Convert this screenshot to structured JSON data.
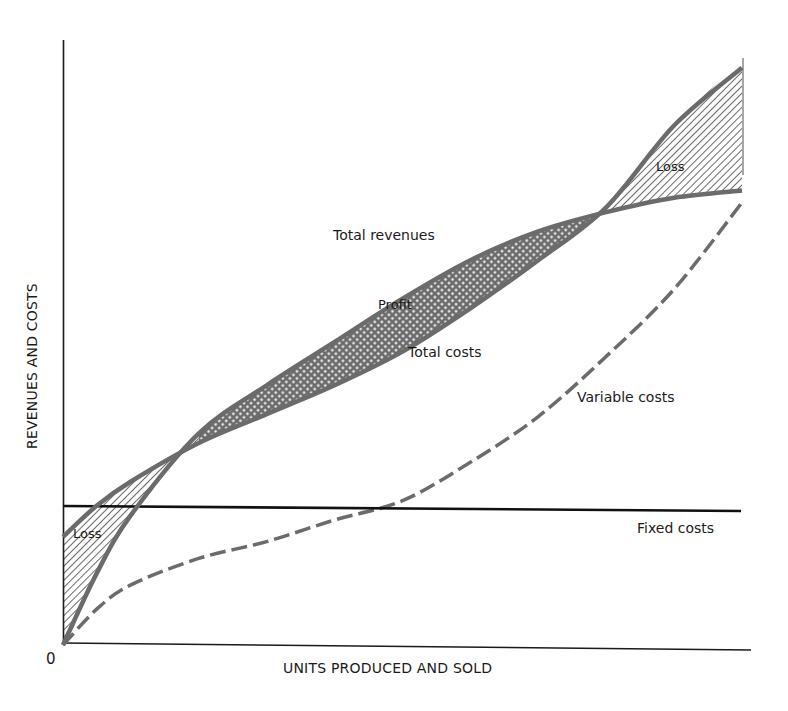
{
  "chart_data": {
    "type": "line",
    "title": "",
    "xlabel": "UNITS PRODUCED AND SOLD",
    "ylabel": "REVENUES AND COSTS",
    "origin_label": "0",
    "x_range": [
      0,
      100
    ],
    "y_range": [
      0,
      100
    ],
    "grid": false,
    "legend": "none (inline labels)",
    "series": [
      {
        "name": "Total revenues",
        "style": "solid-gray-thick",
        "points": [
          [
            0,
            0
          ],
          [
            5,
            15
          ],
          [
            10,
            27
          ],
          [
            20,
            44
          ],
          [
            30,
            54
          ],
          [
            40,
            63
          ],
          [
            50,
            72
          ],
          [
            60,
            80
          ],
          [
            70,
            86
          ],
          [
            80,
            90
          ],
          [
            90,
            93
          ],
          [
            100,
            94.5
          ]
        ]
      },
      {
        "name": "Total costs",
        "style": "solid-gray-thick",
        "points": [
          [
            0,
            22.5
          ],
          [
            5,
            29
          ],
          [
            10,
            34
          ],
          [
            20,
            42
          ],
          [
            30,
            48
          ],
          [
            40,
            54
          ],
          [
            50,
            61
          ],
          [
            60,
            70
          ],
          [
            70,
            80
          ],
          [
            80,
            91
          ],
          [
            90,
            108
          ],
          [
            100,
            120
          ]
        ]
      },
      {
        "name": "Variable costs",
        "style": "dashed-gray",
        "points": [
          [
            0,
            0
          ],
          [
            5,
            7.5
          ],
          [
            10,
            12.5
          ],
          [
            20,
            18
          ],
          [
            30,
            21.5
          ],
          [
            40,
            26
          ],
          [
            50,
            30
          ],
          [
            60,
            38
          ],
          [
            70,
            47.5
          ],
          [
            80,
            60
          ],
          [
            90,
            74
          ],
          [
            100,
            92
          ]
        ]
      },
      {
        "name": "Fixed costs",
        "style": "solid-black",
        "points": [
          [
            0,
            22.5
          ],
          [
            100,
            22.5
          ]
        ]
      }
    ],
    "annotations": [
      {
        "text": "Loss",
        "region": "early output, total costs above total revenues (hatched)"
      },
      {
        "text": "Profit",
        "region": "middle output, total revenues above total costs (crosshatched)"
      },
      {
        "text": "Loss",
        "region": "late output, total costs above total revenues (hatched)"
      }
    ]
  },
  "labels": {
    "total_revenues": "Total revenues",
    "total_costs": "Total costs",
    "variable_costs": "Variable costs",
    "fixed_costs": "Fixed costs",
    "profit": "Profit",
    "loss_left": "Loss",
    "loss_right": "Loss",
    "origin": "0",
    "xlabel": "UNITS PRODUCED AND SOLD",
    "ylabel": "REVENUES AND COSTS"
  },
  "colors": {
    "curve": "#6b6b6b",
    "axis": "#1a1a1a",
    "fixed": "#111111",
    "hatch": "#6b6b6b"
  }
}
